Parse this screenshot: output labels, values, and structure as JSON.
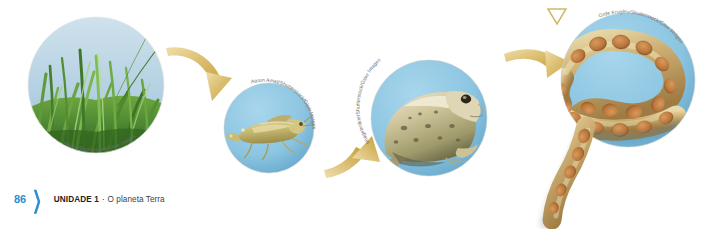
{
  "page": {
    "number": "86",
    "chevron": "❯",
    "unit_label": "UNIDADE 1",
    "separator": "·",
    "unit_subtitle": "O planeta Terra"
  },
  "colors": {
    "page_number": "#2b8fd1",
    "chevron": "#2b8fd1",
    "unit_text": "#231f20",
    "subtitle_text": "#3f3f3f",
    "arrow_gold": "#d9b860",
    "arrow_gold_light": "#efdca4",
    "arrow_gold_dark": "#b9932f",
    "circle_blue": "#8dc6e2",
    "circle_blue_dark": "#64a8cc",
    "sky_blue": "#b9d4e4",
    "grass_green": "#4f8b34",
    "credit_grey": "#6f6f6f",
    "marker_gold": "#cfb86a",
    "background": "#ffffff"
  },
  "diagram": {
    "type": "food-chain",
    "stage_width": 704,
    "stage_height": 229,
    "nodes": [
      {
        "id": "grass",
        "label": "grass",
        "credit": "Yellowj/Shutterstock/Glow Images",
        "shape": "circle",
        "cx": 96,
        "cy": 85,
        "r": 68
      },
      {
        "id": "grasshopper",
        "label": "grasshopper",
        "credit": "Aaron Amat/Shutterstock/Glow Images",
        "shape": "circle",
        "cx": 269,
        "cy": 128,
        "r": 45
      },
      {
        "id": "frog",
        "label": "frog",
        "credit": "Imagebroker/Shutterstock/Glow Images",
        "shape": "circle",
        "cx": 429,
        "cy": 118,
        "r": 58
      },
      {
        "id": "snake",
        "label": "snake",
        "credit": "Orde Kruglov/Shutterstock/Glow Images",
        "shape": "circle",
        "cx": 628,
        "cy": 80,
        "r": 67
      }
    ],
    "arrows": [
      {
        "id": "arrow-grass-to-grasshopper",
        "from": "grass",
        "to": "grasshopper",
        "direction": "down-right"
      },
      {
        "id": "arrow-grasshopper-to-frog",
        "from": "grasshopper",
        "to": "frog",
        "direction": "up-right"
      },
      {
        "id": "arrow-frog-to-snake",
        "from": "frog",
        "to": "snake",
        "direction": "up-right"
      }
    ],
    "markers": [
      {
        "id": "triangle-marker",
        "shape": "triangle-down-outline",
        "x": 555,
        "y": 12
      }
    ]
  }
}
